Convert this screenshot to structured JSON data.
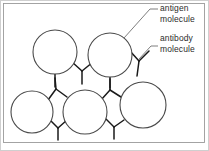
{
  "figure": {
    "domain": "Diagram",
    "frame": {
      "border_color": "#c8c8c8",
      "inner_border_color": "#9a9a9a",
      "background": "#ffffff"
    },
    "colors": {
      "outline": "#4a4a4a",
      "antibody": "#1a1a1a",
      "leader": "#6f6f6f",
      "text": "#2b2b2b"
    }
  },
  "labels": {
    "antigen": {
      "line1": "antigen",
      "line2": "molecule"
    },
    "antibody": {
      "line1": "antibody",
      "line2": "molecule"
    }
  },
  "diagram_data": {
    "type": "schematic",
    "antigens": [
      {
        "id": "antigen-top-left",
        "cx": 55,
        "cy": 52,
        "r": 22
      },
      {
        "id": "antigen-top-right",
        "cx": 110,
        "cy": 55,
        "r": 22
      },
      {
        "id": "antigen-bottom-left",
        "cx": 32,
        "cy": 112,
        "r": 21
      },
      {
        "id": "antigen-bottom-mid",
        "cx": 85,
        "cy": 112,
        "r": 22
      },
      {
        "id": "antigen-bottom-right",
        "cx": 143,
        "cy": 105,
        "r": 23
      }
    ],
    "antibodies": [
      {
        "id": "antibody-top-bridge",
        "x": 82,
        "y": 70,
        "rot": 0,
        "scale": 1.0
      },
      {
        "id": "antibody-upper-right",
        "x": 138,
        "y": 62,
        "rot": 10,
        "scale": 1.0
      },
      {
        "id": "antibody-left-stem",
        "x": 55,
        "y": 76,
        "rot": 0,
        "scale": 1.0
      },
      {
        "id": "antibody-left-mid",
        "x": 59,
        "y": 86,
        "rot": 195,
        "scale": 1.0
      },
      {
        "id": "antibody-center-mid",
        "x": 112,
        "y": 84,
        "rot": 195,
        "scale": 1.0
      },
      {
        "id": "antibody-center-low",
        "x": 57,
        "y": 128,
        "rot": 200,
        "scale": 1.0
      },
      {
        "id": "antibody-right-low",
        "x": 115,
        "y": 126,
        "rot": 200,
        "scale": 1.0
      },
      {
        "id": "antibody-mid-stem",
        "x": 110,
        "y": 80,
        "rot": 0,
        "scale": 1.0
      }
    ],
    "leaders": [
      {
        "id": "leader-antigen",
        "from": [
          157,
          9
        ],
        "to": [
          124,
          38
        ]
      },
      {
        "id": "leader-antibody",
        "from": [
          157,
          46
        ],
        "to": [
          139,
          58
        ]
      }
    ]
  }
}
